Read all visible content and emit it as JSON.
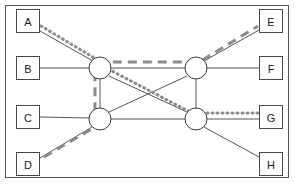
{
  "diagram": {
    "type": "node-link-graph",
    "frame": {
      "x": 5,
      "y": 5,
      "width": 284,
      "height": 173,
      "stroke": "#555555",
      "stroke_width": 1,
      "fill": "#ffffff"
    },
    "colors": {
      "background": "#ffffff",
      "box_stroke": "#4a4a4a",
      "box_fill": "#ffffff",
      "label_text": "#1a1a1a",
      "circle_stroke": "#3a3a3a",
      "circle_fill": "#ffffff",
      "edge_solid": "#555555",
      "overlay_dashed": "#8c8c8c",
      "overlay_dotted": "#8c8c8c"
    },
    "endpoint_boxes": [
      {
        "id": "A",
        "label": "A",
        "x": 16,
        "y": 9,
        "width": 24,
        "height": 24,
        "side": "left",
        "cx": 28,
        "cy": 21
      },
      {
        "id": "B",
        "label": "B",
        "x": 16,
        "y": 56,
        "width": 24,
        "height": 24,
        "side": "left",
        "cx": 28,
        "cy": 68
      },
      {
        "id": "C",
        "label": "C",
        "x": 16,
        "y": 105,
        "width": 24,
        "height": 24,
        "side": "left",
        "cx": 28,
        "cy": 117
      },
      {
        "id": "D",
        "label": "D",
        "x": 16,
        "y": 152,
        "width": 24,
        "height": 24,
        "side": "left",
        "cx": 28,
        "cy": 164
      },
      {
        "id": "E",
        "label": "E",
        "x": 259,
        "y": 9,
        "width": 24,
        "height": 24,
        "side": "right",
        "cx": 271,
        "cy": 21
      },
      {
        "id": "F",
        "label": "F",
        "x": 259,
        "y": 56,
        "width": 24,
        "height": 24,
        "side": "right",
        "cx": 271,
        "cy": 68
      },
      {
        "id": "G",
        "label": "G",
        "x": 259,
        "y": 105,
        "width": 24,
        "height": 24,
        "side": "right",
        "cx": 271,
        "cy": 117
      },
      {
        "id": "H",
        "label": "H",
        "x": 259,
        "y": 152,
        "width": 24,
        "height": 24,
        "side": "right",
        "cx": 271,
        "cy": 164
      }
    ],
    "hub_nodes": [
      {
        "id": "N1",
        "cx": 100,
        "cy": 68,
        "r": 11,
        "position": "top-left"
      },
      {
        "id": "N2",
        "cx": 196,
        "cy": 68,
        "r": 11,
        "position": "top-right"
      },
      {
        "id": "N3",
        "cx": 100,
        "cy": 119,
        "r": 11,
        "position": "bottom-left"
      },
      {
        "id": "N4",
        "cx": 196,
        "cy": 119,
        "r": 11,
        "position": "bottom-right"
      }
    ],
    "solid_edges": [
      {
        "from": "A",
        "to": "N1",
        "x1": 40,
        "y1": 31,
        "x2": 93,
        "y2": 61
      },
      {
        "from": "B",
        "to": "N1",
        "x1": 40,
        "y1": 68,
        "x2": 89,
        "y2": 68
      },
      {
        "from": "C",
        "to": "N3",
        "x1": 40,
        "y1": 117,
        "x2": 89,
        "y2": 118
      },
      {
        "from": "D",
        "to": "N3",
        "x1": 40,
        "y1": 158,
        "x2": 92,
        "y2": 127
      },
      {
        "from": "N1",
        "to": "N2",
        "x1": 111,
        "y1": 68,
        "x2": 185,
        "y2": 68
      },
      {
        "from": "N1",
        "to": "N3",
        "x1": 100,
        "y1": 79,
        "x2": 100,
        "y2": 108
      },
      {
        "from": "N2",
        "to": "N4",
        "x1": 196,
        "y1": 79,
        "x2": 196,
        "y2": 108
      },
      {
        "from": "N3",
        "to": "N4",
        "x1": 111,
        "y1": 119,
        "x2": 185,
        "y2": 119
      },
      {
        "from": "N1",
        "to": "N4",
        "x1": 109,
        "y1": 76,
        "x2": 187,
        "y2": 112
      },
      {
        "from": "N3",
        "to": "N2",
        "x1": 109,
        "y1": 112,
        "x2": 187,
        "y2": 76
      },
      {
        "from": "N2",
        "to": "E",
        "x1": 204,
        "y1": 61,
        "x2": 259,
        "y2": 30
      },
      {
        "from": "N2",
        "to": "F",
        "x1": 207,
        "y1": 68,
        "x2": 259,
        "y2": 68
      },
      {
        "from": "N4",
        "to": "G",
        "x1": 207,
        "y1": 119,
        "x2": 259,
        "y2": 119
      },
      {
        "from": "N4",
        "to": "H",
        "x1": 204,
        "y1": 127,
        "x2": 259,
        "y2": 157
      }
    ],
    "overlay_paths": [
      {
        "name": "dotted-path-A-to-N4",
        "style": "dotted",
        "color": "#8c8c8c",
        "width": 3,
        "dasharray": "1 4",
        "points": "41,26 96,59 112,71 190,112"
      },
      {
        "name": "dashed-path-D-to-N1-to-N2-to-E",
        "style": "dashed",
        "color": "#8c8c8c",
        "width": 3,
        "dasharray": "9 6",
        "points": "44,157 95,127 95,72 110,62 186,62 201,61 258,26"
      },
      {
        "name": "dotted-path-N4-to-G",
        "style": "dotted",
        "color": "#8c8c8c",
        "width": 3,
        "dasharray": "1 4",
        "points": "207,113 258,113"
      }
    ]
  }
}
